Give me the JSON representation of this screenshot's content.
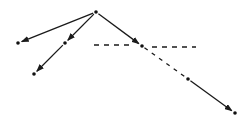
{
  "diagram": {
    "type": "tree-graph",
    "width": 252,
    "height": 122,
    "colors": {
      "stroke": "#1a1a1a",
      "node": "#111111",
      "background": "#ffffff"
    },
    "nodes": [
      {
        "id": "root",
        "x": 96,
        "y": 12
      },
      {
        "id": "left",
        "x": 18,
        "y": 43
      },
      {
        "id": "mid",
        "x": 65,
        "y": 43
      },
      {
        "id": "mid-child",
        "x": 34,
        "y": 74
      },
      {
        "id": "right",
        "x": 142,
        "y": 46
      },
      {
        "id": "right-child",
        "x": 188,
        "y": 79
      },
      {
        "id": "end",
        "x": 235,
        "y": 113
      }
    ],
    "edges": [
      {
        "from": "root",
        "to": "left",
        "style": "solid",
        "arrow": true
      },
      {
        "from": "root",
        "to": "mid",
        "style": "solid",
        "arrow": true
      },
      {
        "from": "root",
        "to": "right",
        "style": "solid",
        "arrow": true
      },
      {
        "from": "mid",
        "to": "mid-child",
        "style": "solid",
        "arrow": true
      },
      {
        "from": "right",
        "to": "right-child",
        "style": "dashed",
        "arrow": false
      },
      {
        "from": "right-child",
        "to": "end",
        "style": "solid",
        "arrow": true
      }
    ],
    "dashed_segments": [
      {
        "x1": 94,
        "y1": 45,
        "x2": 134,
        "y2": 45
      },
      {
        "x1": 152,
        "y1": 47,
        "x2": 196,
        "y2": 47
      }
    ]
  }
}
